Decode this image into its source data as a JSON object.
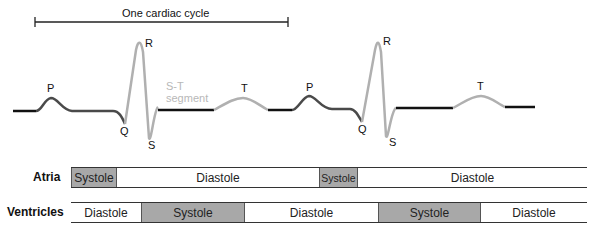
{
  "cycle_label": "One cardiac cycle",
  "waves": {
    "P1": "P",
    "Q1": "Q",
    "R1": "R",
    "S1": "S",
    "T1": "T",
    "P2": "P",
    "Q2": "Q",
    "R2": "R",
    "S2": "S",
    "T2": "T"
  },
  "st_segment": {
    "line1": "S-T",
    "line2": "segment"
  },
  "rows": {
    "atria": {
      "label": "Atria",
      "segments": [
        {
          "label": "Systole",
          "type": "systole",
          "x0": 71,
          "x1": 117
        },
        {
          "label": "Diastole",
          "type": "diastole",
          "x0": 117,
          "x1": 319
        },
        {
          "label": "Systole",
          "type": "systole",
          "x0": 319,
          "x1": 358
        },
        {
          "label": "Diastole",
          "type": "diastole",
          "x0": 358,
          "x1": 587
        }
      ]
    },
    "ventricles": {
      "label": "Ventricles",
      "segments": [
        {
          "label": "Diastole",
          "type": "diastole",
          "x0": 71,
          "x1": 141
        },
        {
          "label": "Systole",
          "type": "systole",
          "x0": 141,
          "x1": 245
        },
        {
          "label": "Diastole",
          "type": "diastole",
          "x0": 245,
          "x1": 378
        },
        {
          "label": "Systole",
          "type": "systole",
          "x0": 378,
          "x1": 481
        },
        {
          "label": "Diastole",
          "type": "diastole",
          "x0": 481,
          "x1": 587
        }
      ]
    }
  },
  "colors": {
    "systole": "#a8a8a8",
    "trace_dark": "#444444",
    "trace_light": "#b0b0b0",
    "baseline": "#111111"
  }
}
